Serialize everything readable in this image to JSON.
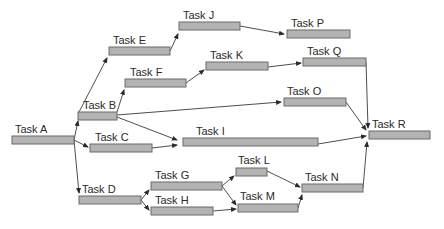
{
  "diagram": {
    "type": "network-diagram",
    "tasks": [
      {
        "id": "A",
        "label": "Task A",
        "x": 12,
        "y": 136,
        "w": 62,
        "lx": 15,
        "ly": 133
      },
      {
        "id": "B",
        "label": "Task B",
        "x": 78,
        "y": 112,
        "w": 39,
        "lx": 83,
        "ly": 109
      },
      {
        "id": "C",
        "label": "Task C",
        "x": 90,
        "y": 144,
        "w": 62,
        "lx": 95,
        "ly": 141
      },
      {
        "id": "D",
        "label": "Task D",
        "x": 79,
        "y": 196,
        "w": 62,
        "lx": 82,
        "ly": 193
      },
      {
        "id": "E",
        "label": "Task E",
        "x": 109,
        "y": 47,
        "w": 61,
        "lx": 113,
        "ly": 44
      },
      {
        "id": "F",
        "label": "Task F",
        "x": 125,
        "y": 79,
        "w": 61,
        "lx": 130,
        "ly": 76
      },
      {
        "id": "G",
        "label": "Task G",
        "x": 151,
        "y": 182,
        "w": 71,
        "lx": 155,
        "ly": 179
      },
      {
        "id": "H",
        "label": "Task H",
        "x": 151,
        "y": 207,
        "w": 62,
        "lx": 155,
        "ly": 204
      },
      {
        "id": "I",
        "label": "Task I",
        "x": 183,
        "y": 138,
        "w": 135,
        "lx": 196,
        "ly": 135
      },
      {
        "id": "J",
        "label": "Task J",
        "x": 179,
        "y": 22,
        "w": 61,
        "lx": 183,
        "ly": 19
      },
      {
        "id": "K",
        "label": "Task K",
        "x": 206,
        "y": 62,
        "w": 62,
        "lx": 210,
        "ly": 59
      },
      {
        "id": "L",
        "label": "Task L",
        "x": 236,
        "y": 168,
        "w": 31,
        "lx": 238,
        "ly": 164
      },
      {
        "id": "M",
        "label": "Task M",
        "x": 238,
        "y": 204,
        "w": 60,
        "lx": 240,
        "ly": 200
      },
      {
        "id": "N",
        "label": "Task N",
        "x": 302,
        "y": 184,
        "w": 61,
        "lx": 305,
        "ly": 181
      },
      {
        "id": "O",
        "label": "Task O",
        "x": 284,
        "y": 98,
        "w": 62,
        "lx": 287,
        "ly": 95
      },
      {
        "id": "P",
        "label": "Task P",
        "x": 287,
        "y": 30,
        "w": 63,
        "lx": 291,
        "ly": 27
      },
      {
        "id": "Q",
        "label": "Task Q",
        "x": 303,
        "y": 58,
        "w": 63,
        "lx": 307,
        "ly": 55
      },
      {
        "id": "R",
        "label": "Task R",
        "x": 369,
        "y": 131,
        "w": 61,
        "lx": 372,
        "ly": 128
      }
    ],
    "edges": [
      {
        "from": "A",
        "to": "B",
        "path": "M74,140 L78,121"
      },
      {
        "from": "A",
        "to": "C",
        "path": "M74,140 L88,147"
      },
      {
        "from": "A",
        "to": "D",
        "path": "M74,140 L79,193"
      },
      {
        "from": "B",
        "to": "E",
        "path": "M79,112 L107,58"
      },
      {
        "from": "B",
        "to": "F",
        "path": "M117,112 L124,90"
      },
      {
        "from": "B",
        "to": "O",
        "path": "M117,115 L281,102"
      },
      {
        "from": "B",
        "to": "I",
        "path": "M117,117 L177,140"
      },
      {
        "from": "C",
        "to": "I",
        "path": "M152,148 L177,145"
      },
      {
        "from": "E",
        "to": "J",
        "path": "M170,51 L178,34"
      },
      {
        "from": "F",
        "to": "K",
        "path": "M186,83 L204,70"
      },
      {
        "from": "J",
        "to": "P",
        "path": "M240,26 L284,34"
      },
      {
        "from": "K",
        "to": "Q",
        "path": "M268,67 L301,63"
      },
      {
        "from": "Q",
        "to": "R",
        "path": "M366,62 L368,128"
      },
      {
        "from": "O",
        "to": "R",
        "path": "M346,102 L366,130"
      },
      {
        "from": "I",
        "to": "R",
        "path": "M318,144 L366,136"
      },
      {
        "from": "N",
        "to": "R",
        "path": "M363,188 L367,142"
      },
      {
        "from": "D",
        "to": "G",
        "path": "M141,200 L149,190"
      },
      {
        "from": "D",
        "to": "H",
        "path": "M141,200 L149,210"
      },
      {
        "from": "G",
        "to": "L",
        "path": "M222,186 L234,176"
      },
      {
        "from": "G",
        "to": "M",
        "path": "M222,186 L236,205"
      },
      {
        "from": "H",
        "to": "M",
        "path": "M213,211 L236,209"
      },
      {
        "from": "L",
        "to": "N",
        "path": "M267,171 L300,187"
      },
      {
        "from": "M",
        "to": "N",
        "path": "M298,208 L302,195"
      }
    ]
  },
  "colors": {
    "bar_fill": "#b3b3b3",
    "bar_stroke": "#6a6a6a",
    "line": "#3a3a3a",
    "text": "#2a2a2a"
  }
}
